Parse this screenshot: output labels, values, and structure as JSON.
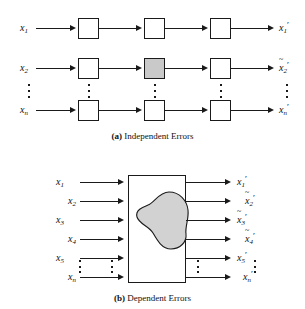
{
  "figure": {
    "panels": [
      {
        "id": "a",
        "caption_tag": "(a)",
        "caption_text": "Independent Errors",
        "inputs": [
          {
            "base": "x",
            "sub": "1",
            "prime": false,
            "accent": ""
          },
          {
            "base": "x",
            "sub": "2",
            "prime": false,
            "accent": ""
          },
          {
            "base": "x",
            "sub": "n",
            "prime": false,
            "accent": ""
          }
        ],
        "outputs": [
          {
            "base": "x",
            "sub": "1",
            "prime": true,
            "accent": ""
          },
          {
            "base": "x",
            "sub": "2",
            "prime": true,
            "accent": "~"
          },
          {
            "base": "x",
            "sub": "n",
            "prime": true,
            "accent": ""
          }
        ],
        "stages": 3,
        "shaded_stage_row": 2,
        "shaded_stage_col": 2,
        "ellipsis": "vertical-dots"
      },
      {
        "id": "b",
        "caption_tag": "(b)",
        "caption_text": "Dependent Errors",
        "inputs": [
          {
            "base": "x",
            "sub": "1",
            "prime": false,
            "accent": ""
          },
          {
            "base": "x",
            "sub": "2",
            "prime": false,
            "accent": ""
          },
          {
            "base": "x",
            "sub": "3",
            "prime": false,
            "accent": ""
          },
          {
            "base": "x",
            "sub": "4",
            "prime": false,
            "accent": ""
          },
          {
            "base": "x",
            "sub": "5",
            "prime": false,
            "accent": ""
          },
          {
            "base": "x",
            "sub": "n",
            "prime": false,
            "accent": ""
          }
        ],
        "outputs": [
          {
            "base": "x",
            "sub": "1",
            "prime": true,
            "accent": ""
          },
          {
            "base": "x",
            "sub": "2",
            "prime": true,
            "accent": "~"
          },
          {
            "base": "x",
            "sub": "3",
            "prime": true,
            "accent": "~"
          },
          {
            "base": "x",
            "sub": "4",
            "prime": true,
            "accent": "~"
          },
          {
            "base": "x",
            "sub": "5",
            "prime": true,
            "accent": ""
          },
          {
            "base": "x",
            "sub": "n",
            "prime": true,
            "accent": ""
          }
        ],
        "block": "single-processing-block",
        "inner_shape": "irregular-blob",
        "ellipsis": "vertical-dots"
      }
    ]
  },
  "colors": {
    "line": "#1a1a1a",
    "box_fill": "#ffffff",
    "shaded_fill": "#c9c9c9",
    "blob_fill": "#d0d0d0",
    "background": "#ffffff"
  }
}
